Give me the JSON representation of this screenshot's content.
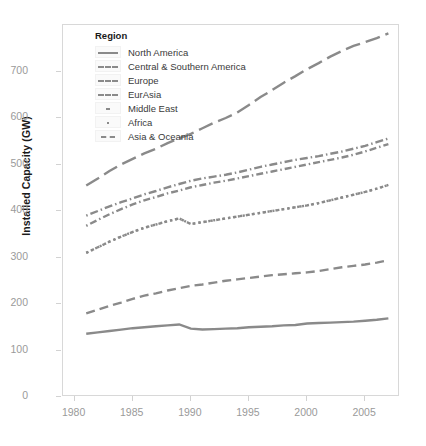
{
  "chart_data": {
    "type": "line",
    "title": "",
    "xlabel": "",
    "ylabel": "Installed Capacity (GW)",
    "xlim": [
      1979,
      2008
    ],
    "ylim": [
      0,
      800
    ],
    "xticks": [
      1980,
      1985,
      1990,
      1995,
      2000,
      2005
    ],
    "yticks": [
      0,
      100,
      200,
      300,
      400,
      500,
      600,
      700
    ],
    "grid": false,
    "legend_position": "top-left-inside",
    "legend_title": "Region",
    "line_color": "#8a8a8a",
    "x": [
      1981,
      1982,
      1983,
      1984,
      1985,
      1986,
      1987,
      1988,
      1989,
      1990,
      1991,
      1992,
      1993,
      1994,
      1995,
      1996,
      1997,
      1998,
      1999,
      2000,
      2001,
      2002,
      2003,
      2004,
      2005,
      2006,
      2007
    ],
    "series": [
      {
        "name": "North America",
        "dash": "solid",
        "values": [
          136,
          139,
          142,
          145,
          148,
          150,
          152,
          154,
          156,
          147,
          145,
          146,
          147,
          148,
          150,
          151,
          152,
          154,
          155,
          158,
          159,
          160,
          161,
          162,
          164,
          166,
          169
        ]
      },
      {
        "name": "Central & Southern America",
        "dash": "dashed",
        "values": [
          180,
          188,
          196,
          203,
          211,
          218,
          223,
          229,
          234,
          239,
          242,
          246,
          250,
          253,
          256,
          259,
          262,
          264,
          266,
          268,
          271,
          275,
          279,
          282,
          285,
          289,
          294
        ]
      },
      {
        "name": "Europe",
        "dash": "dotdash",
        "values": [
          390,
          400,
          410,
          419,
          427,
          436,
          443,
          451,
          458,
          465,
          470,
          474,
          478,
          483,
          489,
          495,
          500,
          505,
          510,
          514,
          518,
          523,
          528,
          534,
          540,
          548,
          556
        ]
      },
      {
        "name": "EurAsia",
        "dash": "dotdash-alt",
        "values": [
          368,
          381,
          393,
          404,
          414,
          423,
          430,
          438,
          444,
          451,
          456,
          461,
          465,
          470,
          475,
          480,
          485,
          490,
          495,
          500,
          505,
          510,
          515,
          521,
          528,
          536,
          544
        ]
      },
      {
        "name": "Middle East",
        "dash": "dotted",
        "values": [
          310,
          322,
          334,
          345,
          355,
          364,
          371,
          378,
          384,
          372,
          376,
          380,
          384,
          388,
          392,
          396,
          400,
          404,
          408,
          412,
          417,
          423,
          429,
          435,
          441,
          448,
          456
        ]
      },
      {
        "name": "Africa",
        "dash": "twodash",
        "values": [
          310,
          322,
          334,
          345,
          355,
          364,
          371,
          378,
          384,
          372,
          376,
          380,
          384,
          388,
          392,
          396,
          400,
          404,
          408,
          412,
          417,
          423,
          429,
          435,
          441,
          448,
          456
        ]
      },
      {
        "name": "Asia & Oceania",
        "dash": "longdash",
        "values": [
          455,
          470,
          486,
          500,
          512,
          524,
          534,
          546,
          556,
          566,
          578,
          590,
          600,
          612,
          628,
          645,
          660,
          676,
          690,
          705,
          718,
          732,
          744,
          755,
          763,
          772,
          782
        ]
      }
    ]
  }
}
